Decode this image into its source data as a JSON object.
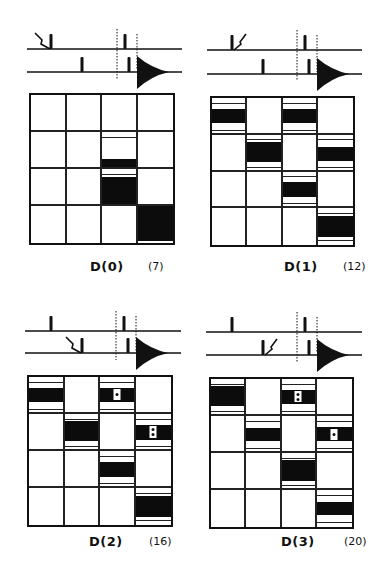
{
  "figure": {
    "panels": [
      {
        "id": "D0",
        "label": "D(0)",
        "count": "(7)",
        "pulse": {
          "zigzag_on": "top",
          "zigzag_side": "left"
        },
        "grid": {
          "rows": 4,
          "cols": 4,
          "bars": [
            {
              "r": 1,
              "c": 2,
              "top": 0.78,
              "bottom": 1.0
            },
            {
              "r": 2,
              "c": 2,
              "top": 0.22,
              "bottom": 1.0
            },
            {
              "r": 3,
              "c": 3,
              "top": 0.0,
              "bottom": 1.0
            }
          ],
          "dots": []
        }
      },
      {
        "id": "D1",
        "label": "D(1)",
        "count": "(12)",
        "pulse": {
          "zigzag_on": "top",
          "zigzag_side": "right"
        },
        "grid": {
          "rows": 4,
          "cols": 4,
          "bars": [
            {
              "r": 0,
              "c": 0,
              "top": 0.32,
              "bottom": 0.72
            },
            {
              "r": 0,
              "c": 2,
              "top": 0.32,
              "bottom": 0.72
            },
            {
              "r": 1,
              "c": 1,
              "top": 0.22,
              "bottom": 0.78
            },
            {
              "r": 1,
              "c": 3,
              "top": 0.35,
              "bottom": 0.75
            },
            {
              "r": 2,
              "c": 2,
              "top": 0.3,
              "bottom": 0.72
            },
            {
              "r": 3,
              "c": 3,
              "top": 0.22,
              "bottom": 0.82
            }
          ],
          "dots": []
        }
      },
      {
        "id": "D2",
        "label": "D(2)",
        "count": "(16)",
        "pulse": {
          "zigzag_on": "bottom",
          "zigzag_side": "left"
        },
        "grid": {
          "rows": 4,
          "cols": 4,
          "bars": [
            {
              "r": 0,
              "c": 0,
              "top": 0.3,
              "bottom": 0.7
            },
            {
              "r": 0,
              "c": 2,
              "top": 0.3,
              "bottom": 0.7
            },
            {
              "r": 1,
              "c": 1,
              "top": 0.2,
              "bottom": 0.78
            },
            {
              "r": 1,
              "c": 3,
              "top": 0.3,
              "bottom": 0.75
            },
            {
              "r": 2,
              "c": 2,
              "top": 0.3,
              "bottom": 0.75
            },
            {
              "r": 3,
              "c": 3,
              "top": 0.22,
              "bottom": 0.82
            }
          ],
          "dots": [
            {
              "r": 0,
              "c": 2,
              "n": 1
            },
            {
              "r": 1,
              "c": 3,
              "n": 2
            }
          ]
        }
      },
      {
        "id": "D3",
        "label": "D(3)",
        "count": "(20)",
        "pulse": {
          "zigzag_on": "bottom",
          "zigzag_side": "right"
        },
        "grid": {
          "rows": 4,
          "cols": 4,
          "bars": [
            {
              "r": 0,
              "c": 0,
              "top": 0.2,
              "bottom": 0.78
            },
            {
              "r": 0,
              "c": 2,
              "top": 0.3,
              "bottom": 0.72
            },
            {
              "r": 1,
              "c": 1,
              "top": 0.35,
              "bottom": 0.72
            },
            {
              "r": 1,
              "c": 3,
              "top": 0.32,
              "bottom": 0.72
            },
            {
              "r": 2,
              "c": 2,
              "top": 0.2,
              "bottom": 0.8
            },
            {
              "r": 3,
              "c": 3,
              "top": 0.35,
              "bottom": 0.72
            }
          ],
          "dots": [
            {
              "r": 0,
              "c": 2,
              "n": 2
            },
            {
              "r": 1,
              "c": 3,
              "n": 1
            }
          ]
        }
      }
    ],
    "colors": {
      "ink": "#111111",
      "background": "#ffffff"
    }
  }
}
